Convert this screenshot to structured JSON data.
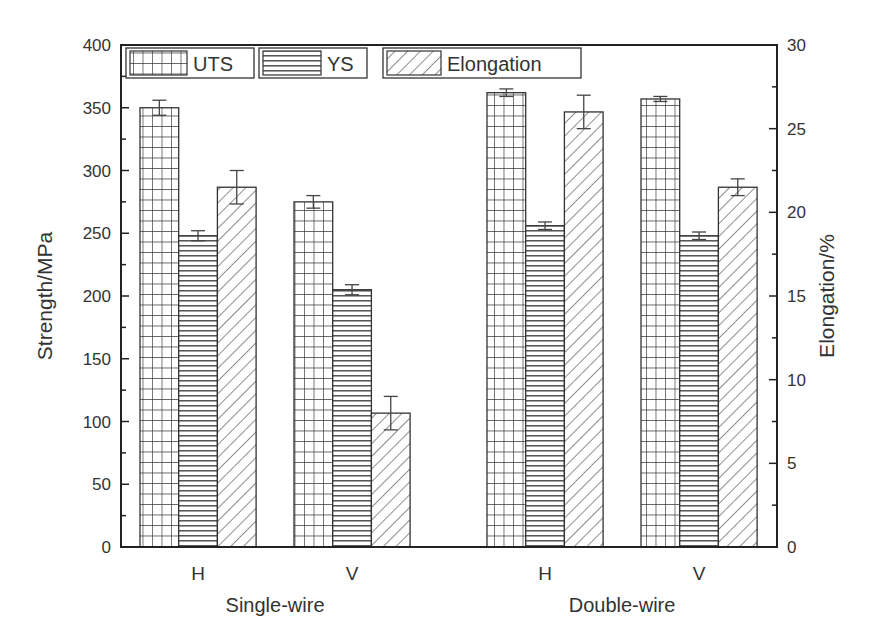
{
  "chart_data": {
    "type": "bar",
    "title": "",
    "groups": [
      {
        "name": "Single-wire",
        "categories": [
          "H",
          "V"
        ]
      },
      {
        "name": "Double-wire",
        "categories": [
          "H",
          "V"
        ]
      }
    ],
    "categories": [
      "Single-wire H",
      "Single-wire V",
      "Double-wire H",
      "Double-wire V"
    ],
    "category_tick_labels": [
      "H",
      "V",
      "H",
      "V"
    ],
    "group_labels": [
      "Single-wire",
      "Double-wire"
    ],
    "series": [
      {
        "name": "UTS",
        "axis": "left",
        "pattern": "grid",
        "values": [
          350,
          275,
          362,
          357
        ],
        "errors": [
          6,
          5,
          3,
          2
        ]
      },
      {
        "name": "YS",
        "axis": "left",
        "pattern": "horizontal",
        "values": [
          248,
          205,
          256,
          248
        ],
        "errors": [
          4,
          4,
          3,
          3
        ]
      },
      {
        "name": "Elongation",
        "axis": "right",
        "pattern": "diagonal",
        "values": [
          21.5,
          8.0,
          26.0,
          21.5
        ],
        "errors": [
          1.0,
          1.0,
          1.0,
          0.5
        ]
      }
    ],
    "ylabel": "Strength/MPa",
    "ylim": [
      0,
      400
    ],
    "yticks": [
      0,
      50,
      100,
      150,
      200,
      250,
      300,
      350,
      400
    ],
    "y2label": "Elongation/%",
    "y2lim": [
      0,
      30
    ],
    "y2ticks": [
      0,
      5,
      10,
      15,
      20,
      25,
      30
    ],
    "xlabel": "",
    "grid": false,
    "legend_position": "top-left-inside"
  },
  "colors": {
    "axis": "#222222",
    "text": "#333333",
    "bar_fill": "#ffffff",
    "pattern": "#333333"
  }
}
